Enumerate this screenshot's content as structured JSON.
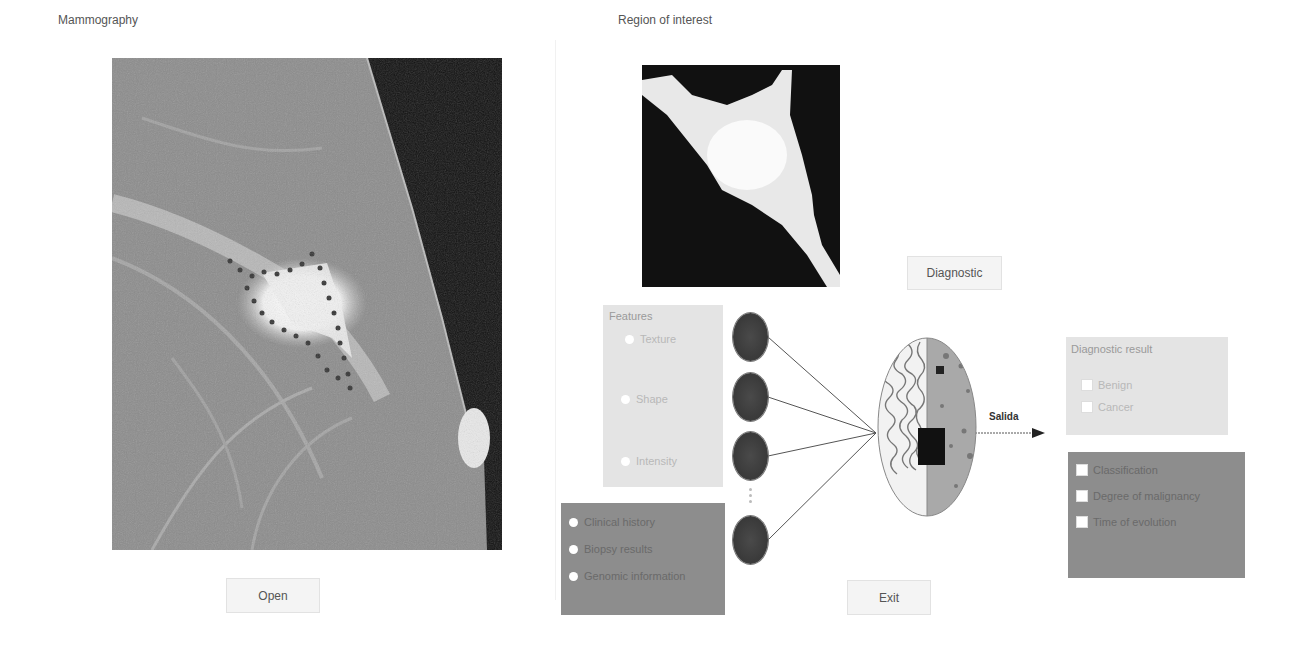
{
  "left_section": {
    "title": "Mammography",
    "open_button": "Open"
  },
  "right_section": {
    "title": "Region of interest",
    "diagnostic_button": "Diagnostic",
    "exit_button": "Exit"
  },
  "features_panel": {
    "title": "Features",
    "options": [
      "Texture",
      "Shape",
      "Intensity"
    ]
  },
  "extra_info_panel": {
    "options": [
      "Clinical history",
      "Biopsy results",
      "Genomic information"
    ]
  },
  "network": {
    "node_count_visible": 4,
    "output_label": "Salida"
  },
  "diagnostic_result_panel": {
    "title": "Diagnostic result",
    "options": [
      "Benign",
      "Cancer"
    ]
  },
  "detail_panel": {
    "options": [
      "Classification",
      "Degree of malignancy",
      "Time of evolution"
    ]
  },
  "colors": {
    "panel_light": "#e4e4e4",
    "panel_dark": "#8d8d8d",
    "node": "#3a3a3a",
    "button_bg": "#f4f4f4"
  }
}
